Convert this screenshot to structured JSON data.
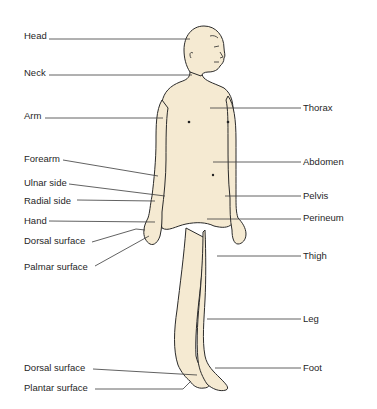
{
  "diagram": {
    "colors": {
      "skin": "#f5ead2",
      "outline": "#2a2a2a",
      "leader": "#3a3a3a",
      "text": "#1f1f1f",
      "background": "#ffffff"
    },
    "labels_left": [
      {
        "id": "head",
        "text": "Head"
      },
      {
        "id": "neck",
        "text": "Neck"
      },
      {
        "id": "arm",
        "text": "Arm"
      },
      {
        "id": "forearm",
        "text": "Forearm"
      },
      {
        "id": "ulnar-side",
        "text": "Ulnar side"
      },
      {
        "id": "radial-side",
        "text": "Radial side"
      },
      {
        "id": "hand",
        "text": "Hand"
      },
      {
        "id": "dorsal-surface-hand",
        "text": "Dorsal surface"
      },
      {
        "id": "palmar-surface",
        "text": "Palmar surface"
      },
      {
        "id": "dorsal-surface-foot",
        "text": "Dorsal surface"
      },
      {
        "id": "plantar-surface",
        "text": "Plantar surface"
      }
    ],
    "labels_right": [
      {
        "id": "thorax",
        "text": "Thorax"
      },
      {
        "id": "abdomen",
        "text": "Abdomen"
      },
      {
        "id": "pelvis",
        "text": "Pelvis"
      },
      {
        "id": "perineum",
        "text": "Perineum"
      },
      {
        "id": "thigh",
        "text": "Thigh"
      },
      {
        "id": "leg",
        "text": "Leg"
      },
      {
        "id": "foot",
        "text": "Foot"
      }
    ]
  }
}
